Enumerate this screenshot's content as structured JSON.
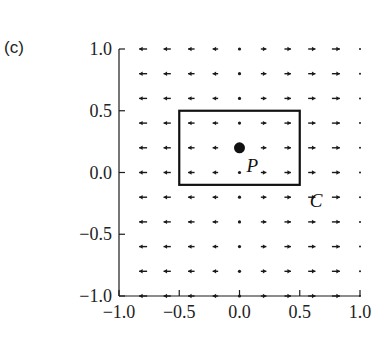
{
  "panel_label": "(c)",
  "axes": {
    "x_ticks": [
      "−1.0",
      "−0.5",
      "0.0",
      "0.5",
      "1.0"
    ],
    "y_ticks": [
      "1.0",
      "0.5",
      "0.0",
      "−0.5",
      "−1.0"
    ],
    "xlim": [
      -1.0,
      1.0
    ],
    "ylim": [
      -1.0,
      1.0
    ]
  },
  "curve": {
    "label": "C",
    "x0": -0.5,
    "x1": 0.5,
    "y0": -0.1,
    "y1": 0.5
  },
  "point": {
    "label": "P",
    "x": 0.0,
    "y": 0.2
  },
  "vector_field": {
    "direction": "horizontal",
    "columns_x": [
      -0.8,
      -0.6,
      -0.4,
      -0.2,
      0.0,
      0.2,
      0.4,
      0.6,
      0.8,
      1.0
    ],
    "rows_y": [
      1.0,
      0.8,
      0.6,
      0.4,
      0.2,
      0.0,
      -0.2,
      -0.4,
      -0.6,
      -0.8,
      -1.0
    ],
    "relative_magnitude": [
      -1.0,
      -0.85,
      -0.7,
      -0.5,
      0.0,
      0.5,
      0.7,
      0.85,
      1.0,
      0.0
    ]
  },
  "colors": {
    "ink": "#1a1a1a",
    "background": "#ffffff"
  }
}
